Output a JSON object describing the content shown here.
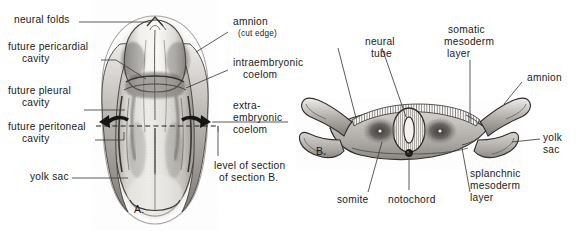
{
  "figure": {
    "panels": [
      {
        "id": "A",
        "letter": "A.",
        "caption": "dorsal view of embryo with amnion cut"
      },
      {
        "id": "B",
        "letter": "B.",
        "caption": "transverse section through embryo"
      }
    ]
  },
  "labels": {
    "neural_folds": "neural folds",
    "future_pericardial": "future pericardial",
    "future_pericardial_2": "cavity",
    "future_pleural": "future pleural",
    "future_pleural_2": "cavity",
    "future_peritoneal": "future peritoneal",
    "future_peritoneal_2": "cavity",
    "yolk_sac_a": "yolk sac",
    "amnion_cut": "amnion",
    "amnion_cut_sub": "(cut edge)",
    "intraembryonic": "intraembryonic",
    "intraembryonic_2": "coelom",
    "extra": "extra-",
    "embryonic": "embryonic",
    "coelom": "coelom",
    "level_of_section": "level of section",
    "level_of_section_2": "of section B.",
    "neural_tube": "neural",
    "neural_tube_2": "tube",
    "somatic": "somatic",
    "somatic_2": "mesoderm",
    "somatic_3": "layer",
    "amnion_b": "amnion",
    "yolk_sac_b": "yolk",
    "yolk_sac_b_2": "sac",
    "splanchnic": "splanchnic",
    "splanchnic_2": "mesoderm",
    "splanchnic_3": "layer",
    "somite": "somite",
    "notochord": "notochord",
    "panel_a_letter": "A.",
    "panel_b_letter": "B."
  },
  "colors": {
    "background": "#ffffff",
    "ink": "#1a1a1a",
    "leader_line": "#4a4a4a",
    "tissue_light": "#e9e7e4",
    "tissue_mid": "#b9b6b2",
    "tissue_dark": "#6e6b68",
    "tissue_darker": "#3a3836",
    "halo": "#f2f1ef"
  }
}
